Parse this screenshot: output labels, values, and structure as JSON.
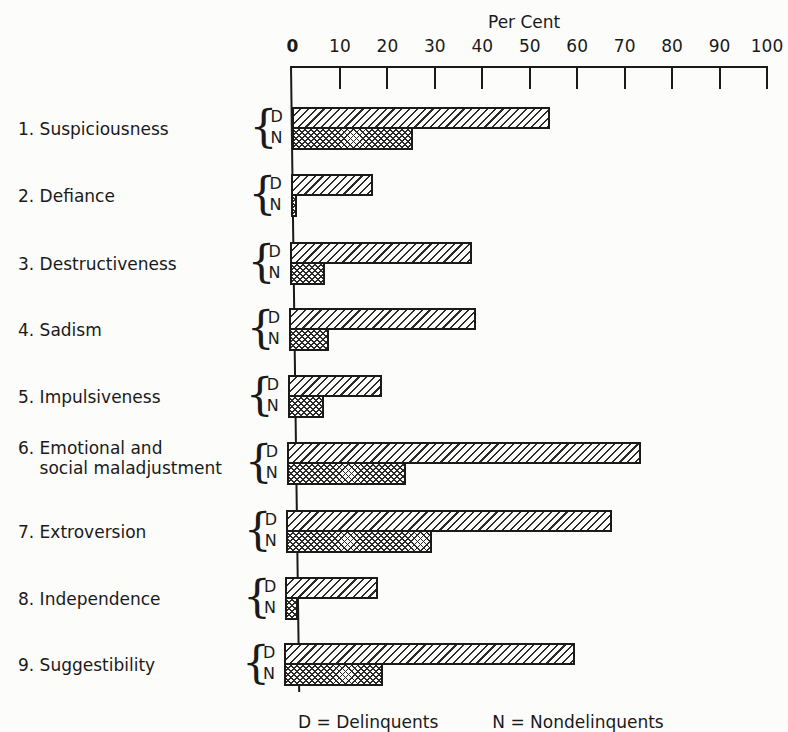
{
  "chart_data": {
    "type": "bar",
    "orientation": "horizontal",
    "title": "",
    "xlabel": "Per Cent",
    "ylabel": "",
    "xlim": [
      0,
      100
    ],
    "x_ticks": [
      0,
      10,
      20,
      30,
      40,
      50,
      60,
      70,
      80,
      90,
      100
    ],
    "grid": false,
    "legend": "inline group labels D / N beside each category brace",
    "categories": [
      "1. Suspiciousness",
      "2. Defiance",
      "3. Destructiveness",
      "4. Sadism",
      "5. Impulsiveness",
      "6. Emotional and social maladjustment",
      "7. Extroversion",
      "8. Independence",
      "9. Suggestibility"
    ],
    "series": [
      {
        "name": "D",
        "pattern": "diagonal hatch",
        "values": [
          54.5,
          17.3,
          38.4,
          39.4,
          19.8,
          74.7,
          68.7,
          19.7,
          61.4
        ]
      },
      {
        "name": "N",
        "pattern": "cross hatch",
        "values": [
          25.6,
          1.3,
          7.4,
          8.6,
          7.6,
          25.2,
          30.8,
          2.7,
          20.8
        ]
      }
    ]
  },
  "axis": {
    "title": "Per Cent",
    "ticks": [
      "0",
      "10",
      "20",
      "30",
      "40",
      "50",
      "60",
      "70",
      "80",
      "90",
      "100"
    ]
  },
  "rows": [
    {
      "label": "1. Suspiciousness",
      "d_label": "D",
      "n_label": "N"
    },
    {
      "label": "2. Defiance",
      "d_label": "D",
      "n_label": "N"
    },
    {
      "label": "3. Destructiveness",
      "d_label": "D",
      "n_label": "N"
    },
    {
      "label": "4. Sadism",
      "d_label": "D",
      "n_label": "N"
    },
    {
      "label": "5. Impulsiveness",
      "d_label": "D",
      "n_label": "N"
    },
    {
      "label": "6. Emotional and\n    social maladjustment",
      "d_label": "D",
      "n_label": "N"
    },
    {
      "label": "7. Extroversion",
      "d_label": "D",
      "n_label": "N"
    },
    {
      "label": "8. Independence",
      "d_label": "D",
      "n_label": "N"
    },
    {
      "label": "9. Suggestibility",
      "d_label": "D",
      "n_label": "N"
    }
  ],
  "caption_partial": "D = Delinquents          N = Nondelinquents"
}
